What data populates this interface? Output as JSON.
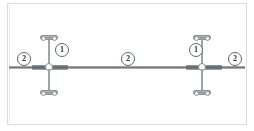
{
  "drawing": {
    "title": "cable-rod-assembly-elevation",
    "background_color": "#ffffff",
    "line_color": "#6f7478",
    "border_color": "#d9dde0",
    "balloon_text_color": "#2f3336"
  },
  "callouts": [
    {
      "id": "balloon-left-2",
      "label": "2",
      "item": "cable",
      "x": 17,
      "y": 52
    },
    {
      "id": "balloon-rod-left-1",
      "label": "1",
      "item": "rod-assembly",
      "x": 55,
      "y": 43
    },
    {
      "id": "balloon-mid-2",
      "label": "2",
      "item": "cable",
      "x": 121,
      "y": 52
    },
    {
      "id": "balloon-rod-right-1",
      "label": "1",
      "item": "rod-assembly",
      "x": 189,
      "y": 43
    },
    {
      "id": "balloon-right-2",
      "label": "2",
      "item": "cable",
      "x": 228,
      "y": 52
    }
  ],
  "components": [
    {
      "ref": "1",
      "name": "vertical tension rod with clevis end fittings",
      "count": 2
    },
    {
      "ref": "2",
      "name": "horizontal cable / tie rod run",
      "count": 3
    }
  ],
  "geometry": {
    "cable_y": 66,
    "rod_left_x": 49,
    "rod_right_x": 202,
    "rod_top_y": 35,
    "rod_bottom_y": 90
  }
}
